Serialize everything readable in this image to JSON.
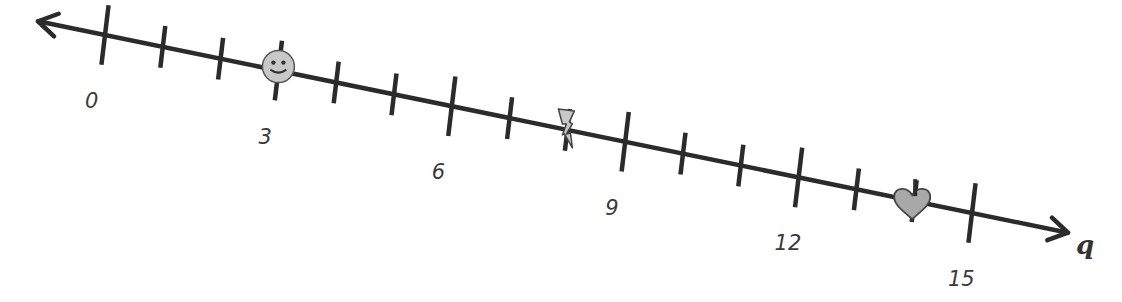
{
  "chart_data": {
    "type": "number_line",
    "variable": "q",
    "min": 0,
    "max": 15,
    "minor_step": 1,
    "labeled_ticks": [
      0,
      3,
      6,
      9,
      12,
      15
    ],
    "tick_labels": [
      "0",
      "3",
      "6",
      "9",
      "12",
      "15"
    ],
    "arrows": [
      "left",
      "right"
    ],
    "markers": [
      {
        "icon": "smiley-face-icon",
        "value": 3
      },
      {
        "icon": "lightning-bolt-icon",
        "value": 8
      },
      {
        "icon": "heart-icon",
        "value": 14
      }
    ]
  },
  "axis": {
    "variable_label": "q"
  },
  "colors": {
    "line": "#2b2b2b",
    "marker_fill": "#c8c8c8",
    "heart_fill": "#a8a8a8"
  }
}
